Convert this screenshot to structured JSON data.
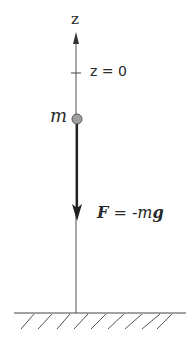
{
  "diagram": {
    "axis": {
      "label": "z",
      "zero_label": "z = 0"
    },
    "mass": {
      "label": "m"
    },
    "force": {
      "symbol": "F",
      "equals": " = -",
      "mass_symbol": "m",
      "gravity_symbol": "g"
    },
    "ground": {
      "hatch_count": 9
    },
    "colors": {
      "line": "#3a3a3a",
      "mass_fill": "#a0a0a0",
      "text": "#2a2a2a"
    }
  }
}
